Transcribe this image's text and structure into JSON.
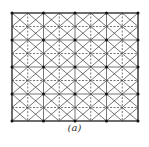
{
  "figure": {
    "caption": "(a)",
    "frame": {
      "x0": 12,
      "y0": 13,
      "x1": 138,
      "y1": 121
    },
    "cols": 4,
    "rows": 4,
    "line_color": "#3a3a3a",
    "node_color": "#111111"
  }
}
